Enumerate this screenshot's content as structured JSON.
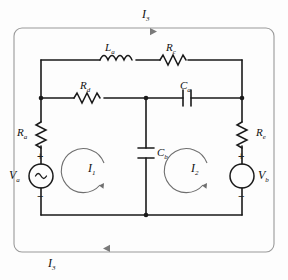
{
  "diagram": {
    "type": "electrical-schematic",
    "line_color": "#1a1a1a",
    "outer_loop_color": "#8a8a8a",
    "background": "#fdfdfd"
  },
  "currents": {
    "top": {
      "symbol": "I",
      "sub": "3",
      "direction": "right"
    },
    "bottom": {
      "symbol": "I",
      "sub": "3",
      "direction": "left"
    },
    "mesh1": {
      "symbol": "I",
      "sub": "1",
      "direction": "counterclockwise"
    },
    "mesh2": {
      "symbol": "I",
      "sub": "2",
      "direction": "counterclockwise"
    }
  },
  "components": {
    "inductor_top_left": {
      "symbol": "L",
      "sub": "a",
      "kind": "inductor"
    },
    "resistor_top_right": {
      "symbol": "R",
      "sub": "c",
      "kind": "resistor"
    },
    "resistor_mid_left": {
      "symbol": "R",
      "sub": "d",
      "kind": "resistor"
    },
    "capacitor_mid_right": {
      "symbol": "C",
      "sub": "a",
      "kind": "capacitor"
    },
    "capacitor_center": {
      "symbol": "C",
      "sub": "b",
      "kind": "capacitor"
    },
    "resistor_left": {
      "symbol": "R",
      "sub": "a",
      "kind": "resistor"
    },
    "resistor_right": {
      "symbol": "R",
      "sub": "e",
      "kind": "resistor"
    },
    "source_left": {
      "symbol": "V",
      "sub": "a",
      "kind": "ac-source",
      "plus": "+",
      "minus": "−"
    },
    "source_right": {
      "symbol": "V",
      "sub": "b",
      "kind": "dc-source",
      "plus": "+",
      "minus": "−"
    }
  }
}
